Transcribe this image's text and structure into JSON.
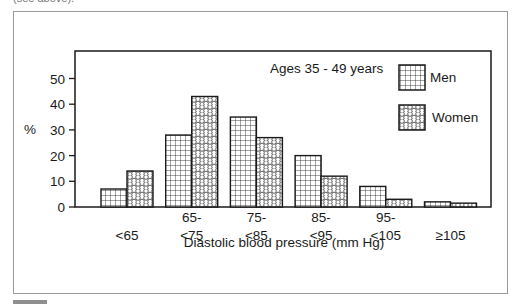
{
  "page": {
    "caption_fragment": "(see above)."
  },
  "chart_data": {
    "type": "bar",
    "title": "",
    "annotation": "Ages 35 - 49 years",
    "xlabel": "Diastolic blood pressure (mm Hg)",
    "ylabel": "%",
    "ylim": [
      0,
      58
    ],
    "yticks": [
      0,
      10,
      20,
      30,
      40,
      50
    ],
    "grid": false,
    "legend_position": "top-right",
    "categories": [
      [
        "<65"
      ],
      [
        "65-",
        "<75"
      ],
      [
        "75-",
        "<85"
      ],
      [
        "85-",
        "<95"
      ],
      [
        "95-",
        "<105"
      ],
      [
        "≥105"
      ]
    ],
    "series": [
      {
        "name": "Men",
        "pattern": "grid",
        "values": [
          7,
          28,
          35,
          20,
          8,
          2
        ]
      },
      {
        "name": "Women",
        "pattern": "circles",
        "values": [
          14,
          43,
          27,
          12,
          3,
          1.5
        ]
      }
    ]
  }
}
